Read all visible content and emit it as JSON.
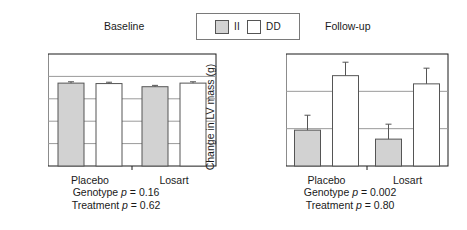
{
  "figure": {
    "panels": [
      {
        "key": "baseline",
        "title": "Baseline",
        "ylabel": "LV mass (g)",
        "caption_line1": "Genotype p = 0.16",
        "caption_line2": "Treatment p = 0.62"
      },
      {
        "key": "followup",
        "title": "Follow-up",
        "ylabel": "Change in LV mass (g)",
        "caption_line1": "Genotype p = 0.002",
        "caption_line2": "Treatment p = 0.80"
      }
    ],
    "legend": {
      "items": [
        {
          "label": "II",
          "color": "#d2d2d2",
          "swatch": "ii"
        },
        {
          "label": "DD",
          "color": "#ffffff",
          "swatch": "dd"
        }
      ]
    }
  },
  "colors": {
    "ii_fill": "#d2d2d2",
    "dd_fill": "#ffffff",
    "bar_stroke": "#555555",
    "axis": "#1a1a1a",
    "grid": "#9a9a9a"
  },
  "chart_data": [
    {
      "type": "bar",
      "title": "Baseline",
      "xlabel": "",
      "ylabel": "LV mass (g)",
      "ylim": [
        0,
        250
      ],
      "yticks": [
        0,
        50,
        100,
        150,
        200,
        250
      ],
      "ytick_labels": [
        "0",
        "50",
        "100",
        "150",
        "200",
        "250"
      ],
      "grid": true,
      "legend_position": "top-center",
      "categories": [
        "Placebo",
        "Losart"
      ],
      "series": [
        {
          "name": "II",
          "values": [
            185,
            177
          ],
          "errors": [
            3,
            3
          ]
        },
        {
          "name": "DD",
          "values": [
            184,
            185
          ],
          "errors": [
            3,
            3
          ]
        }
      ]
    },
    {
      "type": "bar",
      "title": "Follow-up",
      "xlabel": "",
      "ylabel": "Change in LV mass (g)",
      "ylim": [
        0,
        15
      ],
      "yticks": [
        0,
        5,
        10,
        15
      ],
      "ytick_labels": [
        "0",
        "5",
        "10",
        "15"
      ],
      "grid": true,
      "legend_position": "top-center",
      "categories": [
        "Placebo",
        "Losart"
      ],
      "series": [
        {
          "name": "II",
          "values": [
            4.8,
            3.6
          ],
          "errors": [
            2.0,
            2.0
          ]
        },
        {
          "name": "DD",
          "values": [
            12.1,
            11.0
          ],
          "errors": [
            1.8,
            2.1
          ]
        }
      ]
    }
  ]
}
